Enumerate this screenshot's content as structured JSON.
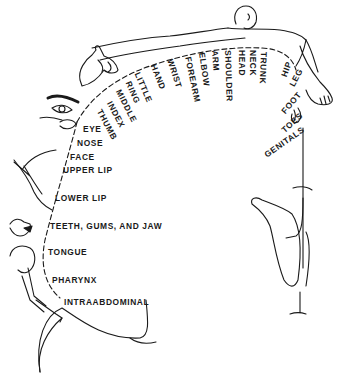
{
  "figure": {
    "ink_color": "#1a1a1a",
    "background": "#ffffff"
  },
  "labels": {
    "arc": [
      {
        "text": "THUMB",
        "x": 103,
        "y": 108,
        "rot": 62
      },
      {
        "text": "INDEX",
        "x": 113,
        "y": 100,
        "rot": 62
      },
      {
        "text": "MIDDLE",
        "x": 122,
        "y": 88,
        "rot": 63
      },
      {
        "text": "RING",
        "x": 132,
        "y": 80,
        "rot": 66
      },
      {
        "text": "LITTLE",
        "x": 141,
        "y": 71,
        "rot": 67
      },
      {
        "text": "HAND",
        "x": 157,
        "y": 63,
        "rot": 68
      },
      {
        "text": "WRIST",
        "x": 174,
        "y": 58,
        "rot": 72
      },
      {
        "text": "FOREARM",
        "x": 192,
        "y": 56,
        "rot": 78
      },
      {
        "text": "ELBOW",
        "x": 206,
        "y": 52,
        "rot": 82
      },
      {
        "text": "ARM",
        "x": 219,
        "y": 50,
        "rot": 86
      },
      {
        "text": "SHOULDER",
        "x": 232,
        "y": 50,
        "rot": 88
      },
      {
        "text": "HEAD",
        "x": 246,
        "y": 50,
        "rot": 90
      },
      {
        "text": "NECK",
        "x": 257,
        "y": 50,
        "rot": 90
      },
      {
        "text": "TRUNK",
        "x": 268,
        "y": 52,
        "rot": 92
      },
      {
        "text": "HIP",
        "x": 285,
        "y": 68,
        "rot": -70
      },
      {
        "text": "LEG",
        "x": 293,
        "y": 74,
        "rot": -62
      },
      {
        "text": "FOOT",
        "x": 283,
        "y": 101,
        "rot": -50
      },
      {
        "text": "TOES",
        "x": 282,
        "y": 118,
        "rot": -42
      },
      {
        "text": "GENITALS",
        "x": 267,
        "y": 142,
        "rot": -35
      }
    ],
    "face": [
      {
        "text": "EYE",
        "x": 83,
        "y": 125
      },
      {
        "text": "NOSE",
        "x": 77,
        "y": 139
      },
      {
        "text": "FACE",
        "x": 70,
        "y": 153
      },
      {
        "text": "UPPER LIP",
        "x": 63,
        "y": 166
      },
      {
        "text": "LOWER LIP",
        "x": 55,
        "y": 194
      },
      {
        "text": "TEETH, GUMS, AND JAW",
        "x": 50,
        "y": 222
      },
      {
        "text": "TONGUE",
        "x": 48,
        "y": 248
      },
      {
        "text": "PHARYNX",
        "x": 52,
        "y": 276
      },
      {
        "text": "INTRAABDOMINAL",
        "x": 64,
        "y": 298
      }
    ]
  }
}
